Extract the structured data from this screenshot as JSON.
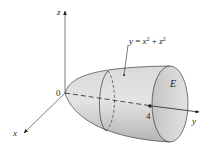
{
  "figure": {
    "type": "3D solid region diagram",
    "axes": {
      "x": "x",
      "y": "y",
      "z": "z",
      "origin": "0"
    },
    "equation": {
      "lhs": "y",
      "eq": " = ",
      "t1": "x",
      "sup1": "2",
      "plus": " + ",
      "t2": "z",
      "sup2": "2"
    },
    "region_label": "E",
    "tick_value": "4",
    "colors": {
      "stroke": "#231f20",
      "fill_light": "#e6e6e6",
      "fill_mid": "#c8c8c8",
      "fill_dark": "#a9a9a9"
    }
  }
}
